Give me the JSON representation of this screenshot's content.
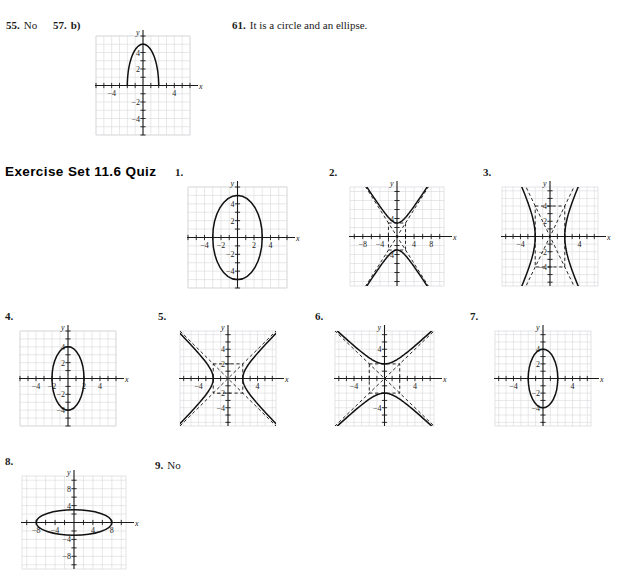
{
  "page": {
    "width": 620,
    "height": 585,
    "background": "#ffffff",
    "ink": "#1a1a1a",
    "grid_color": "#d8d8dc",
    "grid_minor_color": "#e6e6ea",
    "curve_color": "#111111"
  },
  "top_answers": {
    "a55": {
      "num": "55.",
      "text": "No"
    },
    "a57": {
      "num": "57.",
      "text": "b)"
    },
    "a61": {
      "num": "61.",
      "text": "It is a circle and an ellipse."
    }
  },
  "section": {
    "heading": "Exercise Set 11.6 Quiz"
  },
  "labels": {
    "n1": "1.",
    "n2": "2.",
    "n3": "3.",
    "n4": "4.",
    "n5": "5.",
    "n6": "6.",
    "n7": "7.",
    "n8": "8.",
    "n9": "9."
  },
  "answer9": {
    "num": "9.",
    "text": "No"
  },
  "axis": {
    "x": "x",
    "y": "y"
  },
  "chart_data": [
    {
      "id": "g57",
      "label": "57. b)",
      "type": "line",
      "title": "",
      "xlabel": "x",
      "ylabel": "y",
      "xlim": [
        -6,
        6
      ],
      "ylim": [
        -6,
        6
      ],
      "grid": true,
      "xticks": [
        -4,
        4
      ],
      "yticks": [
        -4,
        -2,
        2,
        4
      ],
      "xtick_labels": [
        "-4",
        "4"
      ],
      "ytick_labels": [
        "-4",
        "-2",
        "2",
        "4"
      ],
      "curves": [
        {
          "name": "upper-half-ellipse",
          "kind": "ellipse-upper",
          "center": [
            0,
            0
          ],
          "a": 2,
          "b": 5,
          "style": "solid"
        }
      ],
      "annotations": []
    },
    {
      "id": "g1",
      "label": "1.",
      "type": "line",
      "xlabel": "x",
      "ylabel": "y",
      "xlim": [
        -6,
        6
      ],
      "ylim": [
        -6,
        6
      ],
      "grid": true,
      "xticks": [
        -4,
        -2,
        2,
        4
      ],
      "yticks": [
        -4,
        -2,
        2,
        4
      ],
      "xtick_labels": [
        "-4",
        "-2",
        "2",
        "4"
      ],
      "ytick_labels": [
        "-4",
        "-2",
        "2",
        "4"
      ],
      "curves": [
        {
          "name": "ellipse",
          "kind": "ellipse",
          "center": [
            0,
            0
          ],
          "a": 3,
          "b": 5,
          "style": "solid"
        }
      ]
    },
    {
      "id": "g2",
      "label": "2.",
      "type": "line",
      "xlabel": "x",
      "ylabel": "y",
      "xlim": [
        -11,
        11
      ],
      "ylim": [
        -11,
        11
      ],
      "grid": true,
      "xticks": [
        -8,
        -4,
        4,
        8
      ],
      "yticks": [
        -4,
        4
      ],
      "xtick_labels": [
        "-8",
        "-4",
        "4",
        "8"
      ],
      "ytick_labels": [
        "-4",
        "4"
      ],
      "curves": [
        {
          "name": "hyperbola-vertical",
          "kind": "hyperbola-vertical",
          "center": [
            0,
            0
          ],
          "a": 3,
          "b": 2,
          "style": "solid"
        },
        {
          "name": "asymptotes",
          "kind": "asymptotes",
          "style": "dashed"
        },
        {
          "name": "fundamental-rectangle",
          "kind": "rectangle",
          "style": "dashed"
        }
      ]
    },
    {
      "id": "g3",
      "label": "3.",
      "type": "line",
      "xlabel": "x",
      "ylabel": "y",
      "xlim": [
        -6.5,
        6.5
      ],
      "ylim": [
        -6.5,
        6.5
      ],
      "grid": true,
      "xticks": [
        -4,
        4
      ],
      "yticks": [
        -4,
        -2,
        2,
        4
      ],
      "xtick_labels": [
        "-4",
        "4"
      ],
      "ytick_labels": [
        "-4",
        "-2",
        "2",
        "4"
      ],
      "curves": [
        {
          "name": "hyperbola-horizontal",
          "kind": "hyperbola-horizontal",
          "center": [
            0,
            0
          ],
          "a": 2,
          "b": 4,
          "style": "solid"
        },
        {
          "name": "asymptotes",
          "kind": "asymptotes",
          "style": "dashed"
        },
        {
          "name": "fundamental-rectangle",
          "kind": "rectangle",
          "style": "dashed"
        }
      ]
    },
    {
      "id": "g4",
      "label": "4.",
      "type": "line",
      "xlabel": "x",
      "ylabel": "y",
      "xlim": [
        -6,
        6
      ],
      "ylim": [
        -6,
        6
      ],
      "grid": true,
      "xticks": [
        -4,
        -2,
        2,
        4
      ],
      "yticks": [
        -4,
        -2,
        2,
        4
      ],
      "xtick_labels": [
        "-4",
        "-2",
        "2",
        "4"
      ],
      "ytick_labels": [
        "-4",
        "-2",
        "2",
        "4"
      ],
      "curves": [
        {
          "name": "ellipse",
          "kind": "ellipse",
          "center": [
            0,
            0
          ],
          "a": 2,
          "b": 4,
          "style": "solid"
        }
      ]
    },
    {
      "id": "g5",
      "label": "5.",
      "type": "line",
      "xlabel": "x",
      "ylabel": "y",
      "xlim": [
        -6.5,
        6.5
      ],
      "ylim": [
        -6.5,
        6.5
      ],
      "grid": true,
      "xticks": [
        -4,
        4
      ],
      "yticks": [
        -4,
        -2,
        2,
        4
      ],
      "xtick_labels": [
        "-4",
        "4"
      ],
      "ytick_labels": [
        "-4",
        "-2",
        "2",
        "4"
      ],
      "curves": [
        {
          "name": "hyperbola-horizontal",
          "kind": "hyperbola-horizontal",
          "center": [
            0,
            0
          ],
          "a": 2,
          "b": 2,
          "style": "solid"
        },
        {
          "name": "asymptotes",
          "kind": "asymptotes",
          "style": "dashed"
        },
        {
          "name": "fundamental-rectangle",
          "kind": "rectangle",
          "style": "dashed"
        }
      ]
    },
    {
      "id": "g6",
      "label": "6.",
      "type": "line",
      "xlabel": "x",
      "ylabel": "y",
      "xlim": [
        -6.5,
        6.5
      ],
      "ylim": [
        -6.5,
        6.5
      ],
      "grid": true,
      "xticks": [
        -4,
        4
      ],
      "yticks": [
        -4,
        4
      ],
      "xtick_labels": [
        "-4",
        "4"
      ],
      "ytick_labels": [
        "-4",
        "4"
      ],
      "curves": [
        {
          "name": "hyperbola-vertical",
          "kind": "hyperbola-vertical",
          "center": [
            0,
            0
          ],
          "a": 2,
          "b": 2,
          "style": "solid"
        },
        {
          "name": "asymptotes",
          "kind": "asymptotes",
          "style": "dashed"
        },
        {
          "name": "fundamental-rectangle",
          "kind": "rectangle",
          "style": "dashed"
        }
      ]
    },
    {
      "id": "g7",
      "label": "7.",
      "type": "line",
      "xlabel": "x",
      "ylabel": "y",
      "xlim": [
        -6.5,
        6.5
      ],
      "ylim": [
        -6.5,
        6.5
      ],
      "grid": true,
      "xticks": [
        -4,
        4
      ],
      "yticks": [
        -4,
        -2,
        2,
        4
      ],
      "xtick_labels": [
        "-4",
        "4"
      ],
      "ytick_labels": [
        "-4",
        "-2",
        "2",
        "4"
      ],
      "curves": [
        {
          "name": "ellipse",
          "kind": "ellipse",
          "center": [
            0,
            0
          ],
          "a": 2,
          "b": 4,
          "style": "solid"
        }
      ]
    },
    {
      "id": "g8",
      "label": "8.",
      "type": "line",
      "xlabel": "x",
      "ylabel": "y",
      "xlim": [
        -11,
        11
      ],
      "ylim": [
        -11,
        11
      ],
      "grid": true,
      "xticks": [
        -8,
        -4,
        4,
        8
      ],
      "yticks": [
        -8,
        -4,
        4,
        8
      ],
      "xtick_labels": [
        "-8",
        "-4",
        "4",
        "8"
      ],
      "ytick_labels": [
        "-8",
        "-4",
        "4",
        "8"
      ],
      "curves": [
        {
          "name": "ellipse",
          "kind": "ellipse",
          "center": [
            0,
            0
          ],
          "a": 8,
          "b": 3,
          "style": "solid"
        }
      ]
    }
  ]
}
